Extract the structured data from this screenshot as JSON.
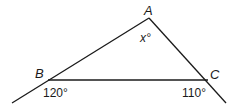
{
  "diagram": {
    "type": "triangle-exterior-angles",
    "vertices": {
      "A": {
        "label": "A",
        "x": 149,
        "y": 18
      },
      "B": {
        "label": "B",
        "x": 48,
        "y": 80
      },
      "C": {
        "label": "C",
        "x": 208,
        "y": 80
      }
    },
    "extensions": {
      "AB_past_B": {
        "x": 12,
        "y": 103
      },
      "AC_past_C": {
        "x": 226,
        "y": 103
      }
    },
    "angles": {
      "interior_A": "x°",
      "exterior_B": "120°",
      "exterior_C": "110°"
    },
    "line_color": "#1a1a1a"
  }
}
